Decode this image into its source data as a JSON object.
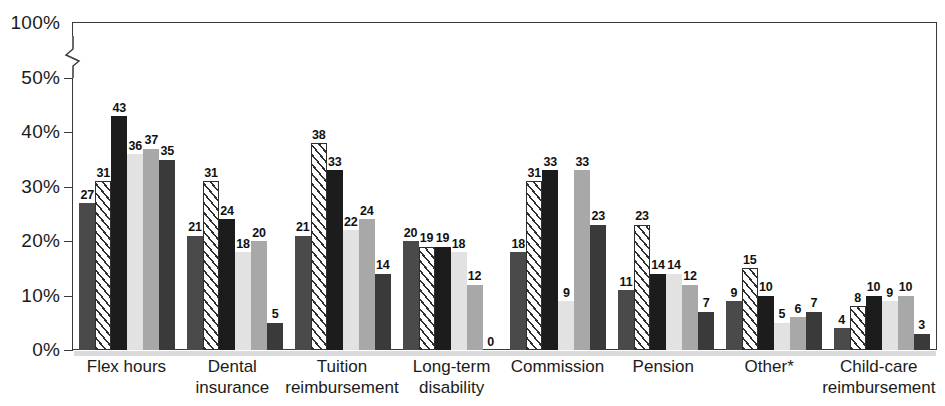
{
  "chart_data": {
    "type": "bar",
    "title": "",
    "subtitle": "",
    "xlabel": "",
    "ylabel": "",
    "ylim": [
      0,
      100
    ],
    "y_axis_break": {
      "from": 50,
      "to": 100,
      "symbol": "zigzag"
    },
    "grid": false,
    "legend_position": "none",
    "y_ticks": [
      "0%",
      "10%",
      "20%",
      "30%",
      "40%",
      "50%",
      "100%"
    ],
    "y_tick_values": [
      0,
      10,
      20,
      30,
      40,
      50,
      100
    ],
    "categories": [
      "Flex hours",
      "Dental insurance",
      "Tuition reimbursement",
      "Long-term disability",
      "Commission",
      "Pension",
      "Other*",
      "Child-care reimbursement"
    ],
    "category_lines": [
      [
        "Flex hours"
      ],
      [
        "Dental insurance"
      ],
      [
        "Tuition",
        "reimbursement"
      ],
      [
        "Long-term",
        "disability"
      ],
      [
        "Commission"
      ],
      [
        "Pension"
      ],
      [
        "Other*"
      ],
      [
        "Child-care",
        "reimbursement"
      ]
    ],
    "series": [
      {
        "name": "series-1",
        "fill": "dark-gray-solid",
        "values": [
          27,
          21,
          21,
          20,
          18,
          11,
          9,
          4
        ]
      },
      {
        "name": "series-2",
        "fill": "white-diagonal-hatch",
        "values": [
          31,
          31,
          38,
          19,
          31,
          23,
          15,
          8
        ]
      },
      {
        "name": "series-3",
        "fill": "black-solid",
        "values": [
          43,
          24,
          33,
          19,
          33,
          14,
          10,
          10
        ]
      },
      {
        "name": "series-4",
        "fill": "light-gray",
        "values": [
          36,
          18,
          22,
          18,
          9,
          14,
          5,
          9
        ]
      },
      {
        "name": "series-5",
        "fill": "medium-gray",
        "values": [
          37,
          20,
          24,
          12,
          33,
          12,
          6,
          10
        ]
      },
      {
        "name": "series-6",
        "fill": "dark-gray",
        "values": [
          35,
          5,
          14,
          0,
          23,
          7,
          7,
          3
        ]
      }
    ],
    "colors": {
      "series-1": "#4a4a4a",
      "series-2": "#ffffff",
      "series-3": "#1c1c1c",
      "series-4": "#e2e2e2",
      "series-5": "#a8a8a8",
      "series-6": "#3a3a3a",
      "axis": "#3a3a3a",
      "text": "#1b1b1b",
      "background": "#ffffff"
    }
  }
}
